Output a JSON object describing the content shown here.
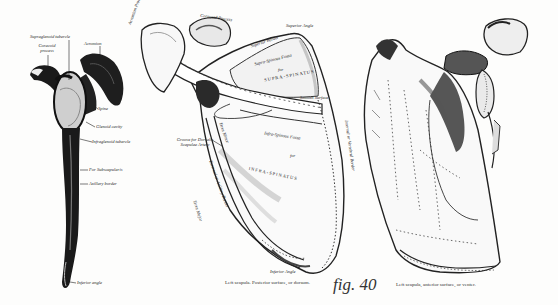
{
  "figure": {
    "number_label": "fig. 40",
    "subject": "Left scapula"
  },
  "panels": [
    {
      "id": "lateral-view",
      "labels": [
        "Supraglenoid tubercle",
        "Coracoid process",
        "Acromion",
        "Spine",
        "Glenoid cavity",
        "Infraglenoid tubercle",
        "For Subscapularis",
        "Axillary border",
        "Inferior angle"
      ]
    },
    {
      "id": "posterior-view",
      "caption": "Left scapula. Posterior surface, or dorsum.",
      "labels": [
        "Acromion Process",
        "Coracoid Process",
        "Superior Border",
        "Superior Angle",
        "Supra-Spinous Fossa",
        "for",
        "SUPRA-SPINATUS",
        "Infra-Spinous Fossa",
        "INFRA-SPINATUS",
        "Groove for Dorsalis Scapulae Artery",
        "Internal or Vertebral Border",
        "External or Axillary Border",
        "Inferior Angle",
        "Teres Major",
        "Teres Minor",
        "Smooth Surface"
      ]
    },
    {
      "id": "anterior-view",
      "caption": "Left scapula, anterior surface, or venter.",
      "labels": []
    }
  ]
}
